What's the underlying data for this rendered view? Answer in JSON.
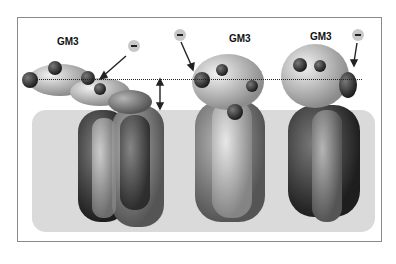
{
  "figure": {
    "labels": [
      "GM3",
      "GM3",
      "GM3"
    ],
    "charge_symbol": "−",
    "panels": [
      {
        "name": "panel-left",
        "label": "GM3"
      },
      {
        "name": "panel-middle",
        "label": "GM3"
      },
      {
        "name": "panel-right",
        "label": "GM3"
      }
    ],
    "colors": {
      "membrane": "#dadada",
      "frame": "#8a8a8a",
      "atom_light": "#c9c9c9",
      "atom_dark": "#3a3a3a"
    }
  }
}
